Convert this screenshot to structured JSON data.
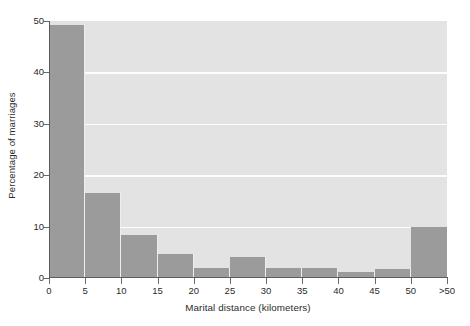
{
  "chart_data": {
    "type": "bar",
    "title": "",
    "subtitle": "",
    "xlabel": "Marital distance (kilometers)",
    "ylabel": "Percentage of marriages",
    "categories": [
      "0-5",
      "5-10",
      "10-15",
      "15-20",
      "20-25",
      "25-30",
      "30-35",
      "35-40",
      "40-45",
      "45-50",
      ">50"
    ],
    "values": [
      49.3,
      16.6,
      8.4,
      4.7,
      2.0,
      4.0,
      2.0,
      2.0,
      1.2,
      1.8,
      10.0
    ],
    "x_tick_labels": [
      "0",
      "5",
      "10",
      "15",
      "20",
      "25",
      "30",
      "35",
      "40",
      "45",
      "50",
      ">50"
    ],
    "y_tick_labels": [
      "0",
      "10",
      "20",
      "30",
      "40",
      "50"
    ],
    "y_ticks": [
      0,
      10,
      20,
      30,
      40,
      50
    ],
    "ylim": [
      0,
      50
    ],
    "xlim": [
      0,
      11
    ],
    "gridlines": [
      10,
      20,
      30,
      40
    ],
    "grid": "horizontal-only",
    "legend": "none",
    "bar_color": "#9b9b9b",
    "plot_background": "#e3e3e3",
    "gridline_color": "#fdfdfd",
    "axis_color": "#5c5c5c",
    "text_color": "#2b2b2b"
  }
}
